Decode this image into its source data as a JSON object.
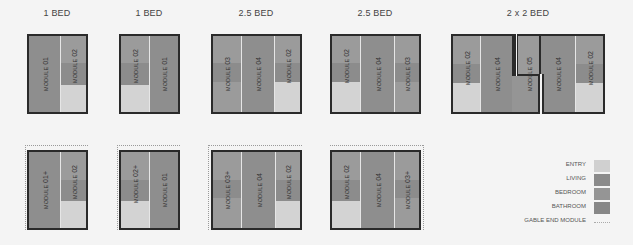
{
  "colors": {
    "entry": "#d3d3d3",
    "living": "#8e8e8e",
    "bedroom": "#9b9b9b",
    "bathroom": "#8a8a8a",
    "outline": "#2a2a2a",
    "gable": "#9a9a9a"
  },
  "plans": [
    {
      "title": "1 BED",
      "modules": [
        {
          "prefix": "MODULE",
          "num": "01"
        },
        {
          "prefix": "MODULE",
          "num": "02"
        }
      ]
    },
    {
      "title": "1 BED",
      "modules": [
        {
          "prefix": "MODULE",
          "num": "02"
        },
        {
          "prefix": "MODULE",
          "num": "01"
        }
      ]
    },
    {
      "title": "2.5 BED",
      "modules": [
        {
          "prefix": "MODULE",
          "num": "03"
        },
        {
          "prefix": "MODULE",
          "num": "04"
        },
        {
          "prefix": "MODULE",
          "num": "02"
        }
      ]
    },
    {
      "title": "2.5 BED",
      "modules": [
        {
          "prefix": "MODULE",
          "num": "02"
        },
        {
          "prefix": "MODULE",
          "num": "04"
        },
        {
          "prefix": "MODULE",
          "num": "03"
        }
      ]
    },
    {
      "title": "2 x 2 BED",
      "modules": [
        {
          "prefix": "MODULE",
          "num": "02"
        },
        {
          "prefix": "MODULE",
          "num": "04"
        },
        {
          "prefix": "MODULE",
          "num": "05"
        },
        {
          "prefix": "MODULE",
          "num": "04"
        },
        {
          "prefix": "MODULE",
          "num": "02"
        }
      ]
    },
    {
      "title": "",
      "modules": [
        {
          "prefix": "MODULE",
          "num": "01+"
        },
        {
          "prefix": "MODULE",
          "num": "02"
        }
      ]
    },
    {
      "title": "",
      "modules": [
        {
          "prefix": "MODULE",
          "num": "02+"
        },
        {
          "prefix": "MODULE",
          "num": "01"
        }
      ]
    },
    {
      "title": "",
      "modules": [
        {
          "prefix": "MODULE",
          "num": "03+"
        },
        {
          "prefix": "MODULE",
          "num": "04"
        },
        {
          "prefix": "MODULE",
          "num": "02"
        }
      ]
    },
    {
      "title": "",
      "modules": [
        {
          "prefix": "MODULE",
          "num": "02"
        },
        {
          "prefix": "MODULE",
          "num": "04"
        },
        {
          "prefix": "MODULE",
          "num": "03+"
        }
      ]
    }
  ],
  "legend": [
    {
      "label": "ENTRY",
      "key": "entry"
    },
    {
      "label": "LIVING",
      "key": "living"
    },
    {
      "label": "BEDROOM",
      "key": "bedroom"
    },
    {
      "label": "BATHROOM",
      "key": "bathroom"
    },
    {
      "label": "GABLE END MODULE",
      "key": "gable"
    }
  ]
}
